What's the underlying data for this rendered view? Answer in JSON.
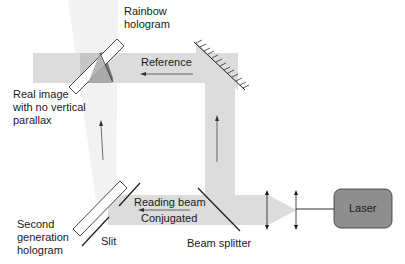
{
  "diagram": {
    "labels": {
      "rainbow_hologram": "Rainbow\nhologram",
      "reference": "Reference",
      "real_image": "Real image\nwith no vertical\nparallax",
      "second_generation_hologram": "Second\ngeneration\nhologram",
      "slit": "Slit",
      "reading_beam": "Reading beam",
      "conjugated": "Conjugated",
      "beam_splitter": "Beam splitter",
      "laser": "Laser"
    },
    "components": [
      {
        "name": "laser",
        "type": "source"
      },
      {
        "name": "lens-1",
        "type": "lens"
      },
      {
        "name": "lens-2",
        "type": "lens"
      },
      {
        "name": "beam-splitter",
        "type": "beam-splitter"
      },
      {
        "name": "mirror",
        "type": "mirror"
      },
      {
        "name": "second-generation-hologram",
        "type": "hologram"
      },
      {
        "name": "slit",
        "type": "aperture"
      },
      {
        "name": "rainbow-hologram",
        "type": "hologram"
      }
    ],
    "colors": {
      "beam": "#dcdcdc",
      "beam_faint": "#f1f1f1",
      "laser_fill": "#8e8e8e",
      "image_dark": "#8a8a8a",
      "image_mid": "#a9a9a9",
      "line": "#1a1a1a"
    }
  }
}
